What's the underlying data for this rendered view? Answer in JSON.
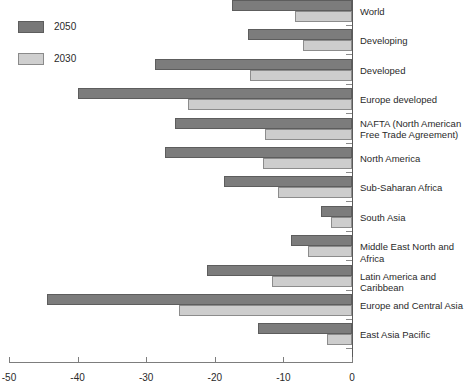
{
  "legend": {
    "position": "top-left",
    "items": [
      {
        "label": "2050",
        "color": "#7c7c7c",
        "key": "v2050"
      },
      {
        "label": "2030",
        "color": "#cdcdcd",
        "key": "v2030"
      }
    ]
  },
  "axis": {
    "ticks": [
      "-50",
      "-40",
      "-30",
      "-20",
      "-10",
      "0"
    ],
    "tick_values": [
      -50,
      -40,
      -30,
      -20,
      -10,
      0
    ],
    "xlim": [
      -50,
      0
    ]
  },
  "chart_data": {
    "type": "bar",
    "orientation": "horizontal",
    "title": "",
    "subtitle": "",
    "xlabel": "",
    "ylabel": "",
    "xlim": [
      -50,
      0
    ],
    "grid": false,
    "legend_position": "top-left",
    "categories": [
      "World",
      "Developing",
      "Developed",
      "Europe developed",
      "NAFTA (North American\nFree Trade Agreement)",
      "North America",
      "Sub-Saharan Africa",
      "South Asia",
      "Middle East North and Africa",
      "Latin America and Caribbean",
      "Europe and Central Asia",
      "East Asia Pacific"
    ],
    "series": [
      {
        "name": "2050",
        "color": "#7c7c7c",
        "values": [
          -17.5,
          -15.2,
          -28.7,
          -40.0,
          -25.8,
          -27.3,
          -18.7,
          -4.5,
          -8.9,
          -21.1,
          -44.5,
          -13.7
        ]
      },
      {
        "name": "2030",
        "color": "#cdcdcd",
        "values": [
          -8.3,
          -7.1,
          -14.9,
          -23.9,
          -12.7,
          -13.0,
          -10.8,
          -3.1,
          -6.4,
          -11.7,
          -25.2,
          -3.6
        ]
      }
    ]
  }
}
